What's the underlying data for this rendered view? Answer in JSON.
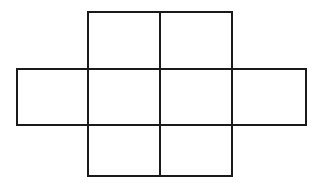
{
  "diagram": {
    "title": "",
    "stroke_color": "#1a1a1a",
    "background": "#ffffff",
    "cells": [
      {
        "row": 0,
        "col": 1,
        "x": 88,
        "y": 12,
        "w": 72,
        "h": 57
      },
      {
        "row": 0,
        "col": 2,
        "x": 160,
        "y": 12,
        "w": 72,
        "h": 57
      },
      {
        "row": 1,
        "col": 0,
        "x": 17,
        "y": 69,
        "w": 71,
        "h": 56
      },
      {
        "row": 1,
        "col": 1,
        "x": 88,
        "y": 69,
        "w": 72,
        "h": 56
      },
      {
        "row": 1,
        "col": 2,
        "x": 160,
        "y": 69,
        "w": 72,
        "h": 56
      },
      {
        "row": 1,
        "col": 3,
        "x": 232,
        "y": 69,
        "w": 74,
        "h": 56
      },
      {
        "row": 2,
        "col": 1,
        "x": 88,
        "y": 125,
        "w": 72,
        "h": 51
      },
      {
        "row": 2,
        "col": 2,
        "x": 160,
        "y": 125,
        "w": 72,
        "h": 51
      }
    ]
  }
}
